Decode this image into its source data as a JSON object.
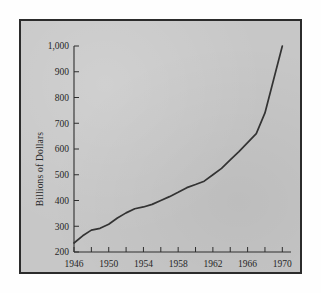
{
  "figure": {
    "background_color": "#fefefe",
    "plate_color": "#c7c7c7",
    "frame_color": "#2b2b2b",
    "line_color": "#333333",
    "text_color": "#262626"
  },
  "chart_data": {
    "type": "line",
    "title": "",
    "subtitle": "",
    "xlabel": "",
    "ylabel": "Billions of Dollars",
    "xlim": [
      1946,
      1971
    ],
    "ylim": [
      200,
      1000
    ],
    "grid": false,
    "legend": null,
    "x_tick_labels": [
      "1946",
      "1950",
      "1954",
      "1958",
      "1962",
      "1966",
      "1970"
    ],
    "x_tick_values": [
      1946,
      1950,
      1954,
      1958,
      1962,
      1966,
      1970
    ],
    "x_minor_tick_values": [
      1946,
      1948,
      1950,
      1952,
      1954,
      1956,
      1958,
      1960,
      1962,
      1964,
      1966,
      1968,
      1970
    ],
    "x_tick_interval": 4,
    "x_minor_tick_interval": 2,
    "y_tick_labels": [
      "200",
      "300",
      "400",
      "500",
      "600",
      "700",
      "800",
      "900",
      "1,000"
    ],
    "y_tick_values": [
      200,
      300,
      400,
      500,
      600,
      700,
      800,
      900,
      1000
    ],
    "y_tick_interval": 100,
    "series": [
      {
        "name": "",
        "x": [
          1946,
          1947,
          1948,
          1949,
          1950,
          1951,
          1952,
          1953,
          1954,
          1955,
          1956,
          1957,
          1958,
          1959,
          1960,
          1961,
          1962,
          1963,
          1964,
          1965,
          1966,
          1967,
          1968,
          1969,
          1970
        ],
        "values": [
          235,
          263,
          285,
          292,
          308,
          332,
          352,
          368,
          375,
          385,
          400,
          415,
          432,
          450,
          462,
          475,
          500,
          525,
          558,
          590,
          625,
          660,
          740,
          870,
          1000
        ]
      }
    ]
  }
}
